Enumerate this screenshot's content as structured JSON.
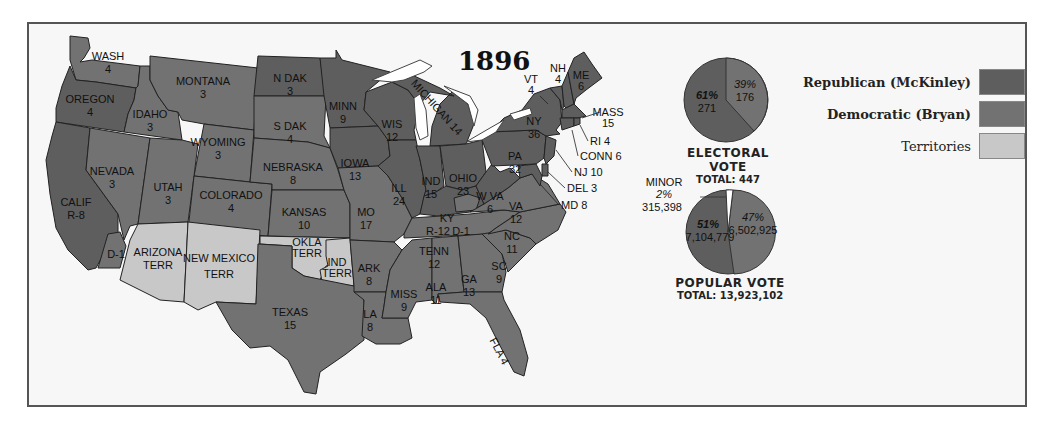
{
  "title": "1896",
  "colors": {
    "republican": "#5e5e5e",
    "democratic": "#727272",
    "territories": "#c8c8c8",
    "water": "#ffffff",
    "border": "#222222"
  },
  "legend": {
    "items": [
      {
        "label": "Republican (McKinley)",
        "color": "#5e5e5e",
        "bold": true
      },
      {
        "label": "Democratic (Bryan)",
        "color": "#727272",
        "bold": true
      },
      {
        "label": "Territories",
        "color": "#c8c8c8",
        "bold": false
      }
    ]
  },
  "electoral_vote": {
    "heading": "ELECTORAL VOTE",
    "total_label": "TOTAL: 447",
    "republican_pct": "61%",
    "republican_votes": "271",
    "democratic_pct": "39%",
    "democratic_votes": "176"
  },
  "popular_vote": {
    "heading": "POPULAR VOTE",
    "total_label": "TOTAL: 13,923,102",
    "republican_pct": "51%",
    "republican_votes": "7,104,779",
    "democratic_pct": "47%",
    "democratic_votes": "6,502,925",
    "minor_label": "MINOR",
    "minor_pct": "2%",
    "minor_votes": "315,398"
  },
  "states": {
    "wash": {
      "name": "WASH",
      "ev": "4",
      "party": "D"
    },
    "oregon": {
      "name": "OREGON",
      "ev": "4",
      "party": "R"
    },
    "calif": {
      "name": "CALIF",
      "ev": "R-8",
      "party": "R",
      "split": "D-1"
    },
    "idaho": {
      "name": "IDAHO",
      "ev": "3",
      "party": "D"
    },
    "nevada": {
      "name": "NEVADA",
      "ev": "3",
      "party": "D"
    },
    "montana": {
      "name": "MONTANA",
      "ev": "3",
      "party": "D"
    },
    "wyoming": {
      "name": "WYOMING",
      "ev": "3",
      "party": "D"
    },
    "utah": {
      "name": "UTAH",
      "ev": "3",
      "party": "D"
    },
    "colorado": {
      "name": "COLORADO",
      "ev": "4",
      "party": "D"
    },
    "arizona": {
      "name": "ARIZONA",
      "ev": "TERR",
      "party": "T"
    },
    "newmexico": {
      "name": "NEW MEXICO",
      "ev": "TERR",
      "party": "T"
    },
    "ndak": {
      "name": "N DAK",
      "ev": "3",
      "party": "R"
    },
    "sdak": {
      "name": "S DAK",
      "ev": "4",
      "party": "D"
    },
    "nebraska": {
      "name": "NEBRASKA",
      "ev": "8",
      "party": "D"
    },
    "kansas": {
      "name": "KANSAS",
      "ev": "10",
      "party": "D"
    },
    "okla": {
      "name": "OKLA",
      "ev": "TERR",
      "party": "T"
    },
    "ind_terr": {
      "name": "IND",
      "ev": "TERR",
      "party": "T"
    },
    "texas": {
      "name": "TEXAS",
      "ev": "15",
      "party": "D"
    },
    "minn": {
      "name": "MINN",
      "ev": "9",
      "party": "R"
    },
    "iowa": {
      "name": "IOWA",
      "ev": "13",
      "party": "R"
    },
    "mo": {
      "name": "MO",
      "ev": "17",
      "party": "D"
    },
    "ark": {
      "name": "ARK",
      "ev": "8",
      "party": "D"
    },
    "la": {
      "name": "LA",
      "ev": "8",
      "party": "D"
    },
    "wis": {
      "name": "WIS",
      "ev": "12",
      "party": "R"
    },
    "ill": {
      "name": "ILL",
      "ev": "24",
      "party": "R"
    },
    "michigan": {
      "name": "MICHIGAN 14",
      "ev": "14",
      "party": "R"
    },
    "ind": {
      "name": "IND",
      "ev": "15",
      "party": "R"
    },
    "ohio": {
      "name": "OHIO",
      "ev": "23",
      "party": "R"
    },
    "ky": {
      "name": "KY",
      "ev": "R-12",
      "party": "R",
      "split": "D-1"
    },
    "tenn": {
      "name": "TENN",
      "ev": "12",
      "party": "D"
    },
    "miss": {
      "name": "MISS",
      "ev": "9",
      "party": "D"
    },
    "ala": {
      "name": "ALA",
      "ev": "11",
      "party": "D"
    },
    "ga": {
      "name": "GA",
      "ev": "13",
      "party": "D"
    },
    "fla": {
      "name": "FLA 4",
      "ev": "4",
      "party": "D"
    },
    "sc": {
      "name": "SC",
      "ev": "9",
      "party": "D"
    },
    "nc": {
      "name": "NC",
      "ev": "11",
      "party": "D"
    },
    "va": {
      "name": "VA",
      "ev": "12",
      "party": "D"
    },
    "wva": {
      "name": "W VA",
      "ev": "6",
      "party": "R"
    },
    "pa": {
      "name": "PA",
      "ev": "32",
      "party": "R"
    },
    "ny": {
      "name": "NY",
      "ev": "36",
      "party": "R"
    },
    "vt": {
      "name": "VT",
      "ev": "4",
      "party": "R"
    },
    "nh": {
      "name": "NH",
      "ev": "4",
      "party": "R"
    },
    "me": {
      "name": "ME",
      "ev": "6",
      "party": "R"
    },
    "mass": {
      "name": "MASS",
      "ev": "15",
      "party": "R"
    },
    "ri": {
      "name": "RI 4",
      "ev": "4",
      "party": "R"
    },
    "conn": {
      "name": "CONN 6",
      "ev": "6",
      "party": "R"
    },
    "nj": {
      "name": "NJ 10",
      "ev": "10",
      "party": "R"
    },
    "del": {
      "name": "DEL 3",
      "ev": "3",
      "party": "R"
    },
    "md": {
      "name": "MD 8",
      "ev": "8",
      "party": "R"
    }
  }
}
